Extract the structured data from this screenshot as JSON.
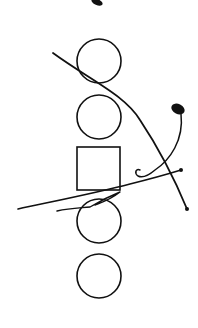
{
  "diagram": {
    "width": 198,
    "height": 328,
    "background": "#ffffff",
    "stroke_color": "#111111",
    "shapes": [
      {
        "id": "circle-1",
        "type": "circle",
        "cx": 99,
        "cy": 61,
        "r": 22
      },
      {
        "id": "circle-2",
        "type": "circle",
        "cx": 99,
        "cy": 117,
        "r": 22
      },
      {
        "id": "square-1",
        "type": "rect",
        "x": 77,
        "y": 147,
        "w": 43,
        "h": 43
      },
      {
        "id": "circle-3",
        "type": "circle",
        "cx": 99,
        "cy": 221,
        "r": 22
      },
      {
        "id": "circle-4",
        "type": "circle",
        "cx": 99,
        "cy": 276,
        "r": 22
      }
    ],
    "strokes": [
      {
        "id": "long-diagonal-curve",
        "d": "M53,53 C90,80 125,95 140,120 C160,150 175,180 187,209",
        "width": 1.8
      },
      {
        "id": "end-dot-diagonal",
        "type": "dot",
        "cx": 187,
        "cy": 209,
        "r": 2
      },
      {
        "id": "hook-curve",
        "d": "M181,114 C184,140 170,160 155,170 C148,176 142,178 138,176 C134,173 136,168 140,170",
        "width": 1.5
      },
      {
        "id": "blob-top-right",
        "type": "blob",
        "cx": 178,
        "cy": 109,
        "rx": 7,
        "ry": 5
      },
      {
        "id": "long-line-left",
        "d": "M18,209 C60,200 100,192 130,184 C150,179 168,174 181,170",
        "width": 1.6
      },
      {
        "id": "end-dot-line",
        "type": "dot",
        "cx": 181,
        "cy": 170,
        "r": 2
      },
      {
        "id": "short-line-lower",
        "d": "M57,211 C70,208 80,208 90,207 C100,201 110,196 120,192 C110,200 100,203 95,205",
        "width": 1.4
      },
      {
        "id": "blob-top",
        "type": "blob",
        "cx": 97,
        "cy": 2,
        "rx": 6,
        "ry": 3
      }
    ]
  }
}
